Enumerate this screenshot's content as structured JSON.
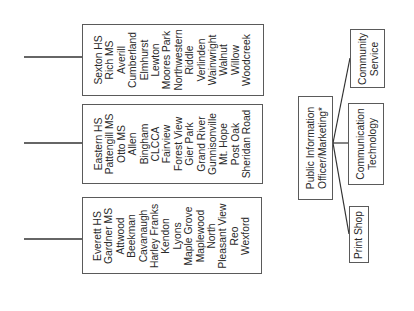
{
  "school_groups": [
    {
      "id": "group-1",
      "schools": [
        "Sexton HS",
        "Rich MS",
        "Averill",
        "Cumberland",
        "Elmhurst",
        "Lewton",
        "Moores Park",
        "Northwestern",
        "Riddle",
        "Verlinden",
        "Wainwright",
        "Walnut",
        "Willow",
        "Woodcreek"
      ]
    },
    {
      "id": "group-2",
      "schools": [
        "Eastern HS",
        "Pattengill MS",
        "Otto MS",
        "Allen",
        "Bingham",
        "CLCCA",
        "Fairview",
        "Forest View",
        "Gier Park",
        "Grand River",
        "Gunnisonville",
        "Mt. Hope",
        "Post Oak",
        "Sheridan Road"
      ]
    },
    {
      "id": "group-3",
      "schools": [
        "Everett HS",
        "Gardner MS",
        "Attwood",
        "Beekman",
        "Cavanaugh",
        "Harley Franks",
        "Kendon",
        "Lyons",
        "Maple Grove",
        "Maplewood",
        "North",
        "Pleasant View",
        "Reo",
        "Wexford"
      ]
    }
  ],
  "org": {
    "root": {
      "line1": "Public Information",
      "line2": "Officer/Marketing*"
    },
    "children": [
      {
        "line1": "Community",
        "line2": "Service"
      },
      {
        "line1": "Communication",
        "line2": "Technology"
      },
      {
        "line1": "Print Shop",
        "line2": ""
      }
    ]
  },
  "colors": {
    "line": "#333333",
    "border": "#5a5a5a",
    "text": "#2a2a2a"
  }
}
